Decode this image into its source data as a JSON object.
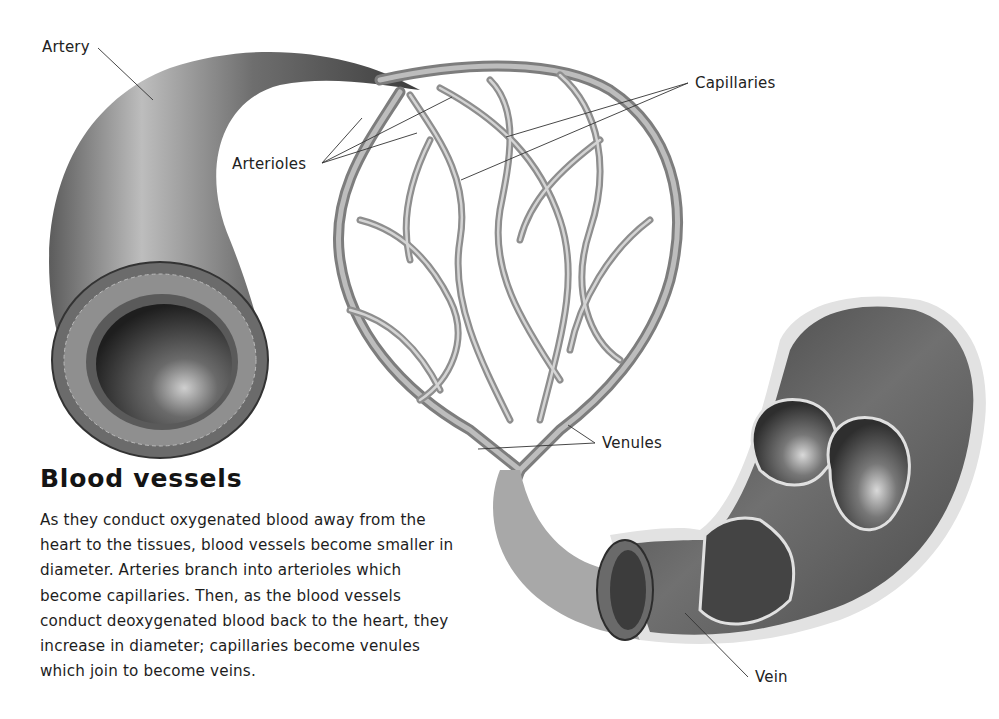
{
  "title": "Blood vessels",
  "description_lines": [
    "As they conduct oxygenated blood away from the",
    "heart to the tissues, blood vessels become smaller in",
    "diameter. Arteries branch into arterioles which",
    "become capillaries. Then, as the blood vessels",
    "conduct deoxygenated blood back to the heart, they",
    "increase in diameter; capillaries become venules",
    "which join to become veins."
  ],
  "labels": {
    "artery": "Artery",
    "arterioles": "Arterioles",
    "capillaries": "Capillaries",
    "venules": "Venules",
    "vein": "Vein"
  },
  "colors": {
    "background": "#ffffff",
    "vessel_dark": "#3a3a3a",
    "vessel_mid": "#7a7a7a",
    "vessel_light": "#c8c8c8",
    "capillary": "#a9a9a9",
    "text": "#1a1a1a"
  }
}
